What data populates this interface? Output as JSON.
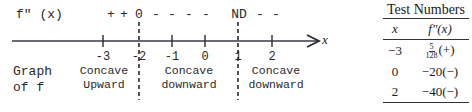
{
  "sign_chart": {
    "function_label": "f″ (x)",
    "signs": [
      {
        "x": 124,
        "text": "+"
      },
      {
        "x": 137,
        "text": "+"
      },
      {
        "x": 139,
        "text": "0"
      },
      {
        "x": 156,
        "text": "-"
      },
      {
        "x": 172,
        "text": "-"
      },
      {
        "x": 189,
        "text": "-"
      },
      {
        "x": 206,
        "text": "-"
      },
      {
        "x": 238,
        "text": "ND"
      },
      {
        "x": 260,
        "text": "-"
      },
      {
        "x": 276,
        "text": "-"
      }
    ],
    "axis_variable": "x",
    "ticks": [
      {
        "value": "-3",
        "x": 103,
        "style": "solid"
      },
      {
        "value": "-2",
        "x": 139,
        "style": "dashed"
      },
      {
        "value": "-1",
        "x": 172,
        "style": "solid"
      },
      {
        "value": "0",
        "x": 205,
        "style": "solid"
      },
      {
        "value": "1",
        "x": 238,
        "style": "dashed"
      },
      {
        "value": "2",
        "x": 272,
        "style": "solid"
      }
    ],
    "graph_label_line1": "Graph",
    "graph_label_line2": "of f",
    "regions": [
      {
        "line1": "Concave",
        "line2": "Upward",
        "x": 104
      },
      {
        "line1": "Concave",
        "line2": "downward",
        "x": 189
      },
      {
        "line1": "Concave",
        "line2": "downward",
        "x": 276
      }
    ],
    "axis_color": "#3a3a4a"
  },
  "test_table": {
    "title": "Test Numbers",
    "headers": [
      "x",
      "f″(x)"
    ],
    "rows": [
      {
        "x": "−3",
        "value_num": "5",
        "value_den": "128",
        "value_sign": "(+)"
      },
      {
        "x": "0",
        "value": "−20(−)"
      },
      {
        "x": "2",
        "value": "−40(−)"
      }
    ]
  }
}
